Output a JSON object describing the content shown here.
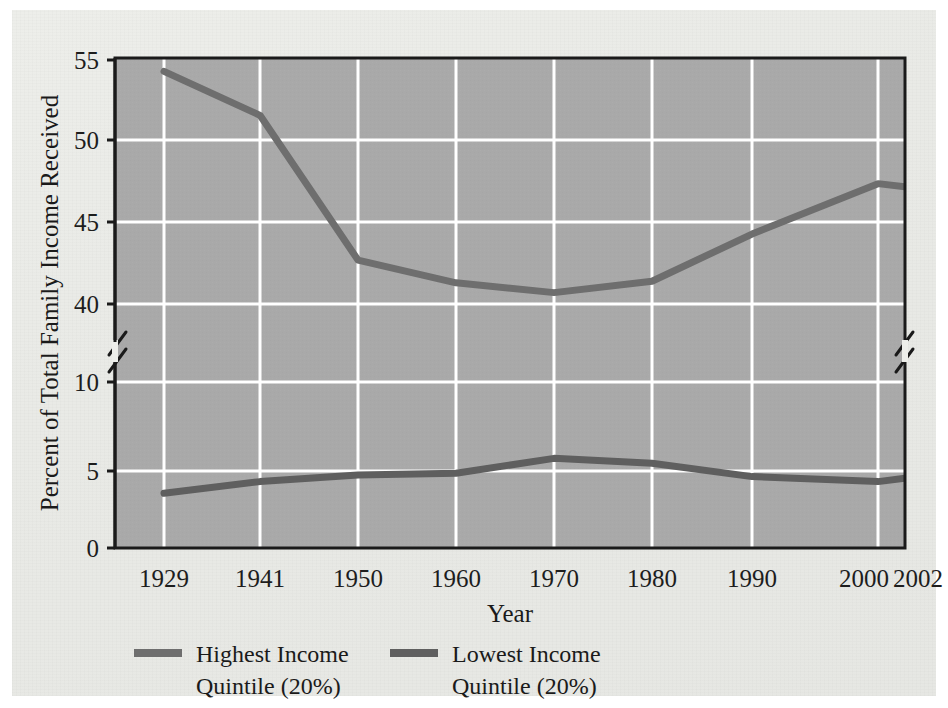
{
  "chart_data": {
    "type": "line",
    "title": "",
    "xlabel": "Year",
    "ylabel": "Percent of Total Family Income Received",
    "categories": [
      "1929",
      "1941",
      "1950",
      "1960",
      "1970",
      "1980",
      "1990",
      "2000",
      "2002"
    ],
    "x": [
      1929,
      1941,
      1950,
      1960,
      1970,
      1980,
      1990,
      2000,
      2002
    ],
    "series": [
      {
        "name": "Highest Income Quintile (20%)",
        "label_line1": "Highest Income",
        "label_line2": "Quintile (20%)",
        "color": "#6e6e6e",
        "values": [
          54.3,
          51.6,
          42.7,
          41.3,
          40.7,
          41.4,
          44.3,
          47.4,
          47.2
        ]
      },
      {
        "name": "Lowest Income Quintile (20%)",
        "label_line1": "Lowest Income",
        "label_line2": "Quintile (20%)",
        "color": "#5f5f5f",
        "values": [
          3.3,
          4.0,
          4.4,
          4.5,
          5.4,
          5.1,
          4.3,
          4.0,
          4.2
        ]
      }
    ],
    "y_ticks_upper": [
      "55",
      "50",
      "45",
      "40"
    ],
    "y_ticks_lower": [
      "10",
      "5",
      "0"
    ],
    "y_ticks_all": [
      "55",
      "50",
      "45",
      "40",
      "10",
      "5",
      "0"
    ],
    "y_axis_break": true,
    "y_axis_break_note": "axis break between 40 and 10",
    "ylim_upper": [
      40,
      55
    ],
    "ylim_lower": [
      0,
      12.5
    ],
    "grid": true,
    "grid_color": "#ffffff",
    "plot_background": "#a9a9a9",
    "legend_position": "below-left",
    "axis_color": "#1a1a1a"
  },
  "axis": {
    "y_title": "Percent of Total Family Income Received",
    "x_title": "Year"
  },
  "ticks": {
    "y": [
      "55",
      "50",
      "45",
      "40",
      "10",
      "5",
      "0"
    ],
    "x": [
      "1929",
      "1941",
      "1950",
      "1960",
      "1970",
      "1980",
      "1990",
      "2000",
      "2002"
    ]
  },
  "legend": {
    "items": [
      {
        "line1": "Highest Income",
        "line2": "Quintile (20%)",
        "swatch": "#6e6e6e"
      },
      {
        "line1": "Lowest Income",
        "line2": "Quintile (20%)",
        "swatch": "#5f5f5f"
      }
    ]
  }
}
